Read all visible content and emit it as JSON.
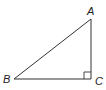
{
  "diagram": {
    "type": "right-triangle",
    "vertices": [
      {
        "name": "A",
        "x": 91,
        "y": 19,
        "label_x": 87,
        "label_y": 15
      },
      {
        "name": "B",
        "x": 14,
        "y": 79,
        "label_x": 3,
        "label_y": 83
      },
      {
        "name": "C",
        "x": 91,
        "y": 79,
        "label_x": 95,
        "label_y": 85
      }
    ],
    "right_angle_at": "C",
    "right_angle_marker_size": 7,
    "stroke_color": "#333333",
    "label_color": "#222222"
  }
}
